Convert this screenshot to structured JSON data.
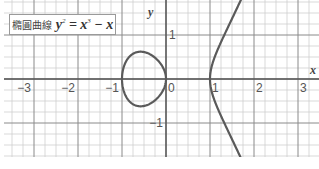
{
  "title": {
    "prefix": "橢圓曲線",
    "equation_lhs": "y",
    "lhs_exp": "2",
    "equals": " = ",
    "rhs_term1": "x",
    "rhs_exp": "3",
    "rhs_rest": " − x"
  },
  "chart_data": {
    "type": "line",
    "xlabel": "x",
    "ylabel": "y",
    "xlim": [
      -3.7,
      3.4
    ],
    "ylim": [
      -1.77,
      1.8
    ],
    "grid": true,
    "minor_grid_step": 0.25,
    "major_grid_step": 1,
    "x_ticks": [
      {
        "value": -3,
        "label": "−3"
      },
      {
        "value": -2,
        "label": "−2"
      },
      {
        "value": -1,
        "label": "−1"
      },
      {
        "value": 0,
        "label": "0"
      },
      {
        "value": 1,
        "label": "1"
      },
      {
        "value": 2,
        "label": "2"
      },
      {
        "value": 3,
        "label": "3"
      }
    ],
    "y_ticks": [
      {
        "value": 1,
        "label": "1"
      },
      {
        "value": -1,
        "label": "−1"
      }
    ],
    "series": [
      {
        "name": "y² = x³ − x (bounded component)",
        "x": [
          -1,
          -0.95,
          -0.9,
          -0.8,
          -0.7,
          -0.577,
          -0.5,
          -0.4,
          -0.3,
          -0.2,
          -0.1,
          -0.05,
          0
        ],
        "y_upper": [
          0,
          0.305,
          0.414,
          0.537,
          0.585,
          0.62,
          0.612,
          0.58,
          0.522,
          0.438,
          0.315,
          0.223,
          0
        ]
      },
      {
        "name": "y² = x³ − x (unbounded component)",
        "x": [
          1,
          1.02,
          1.05,
          1.1,
          1.2,
          1.3,
          1.4,
          1.5,
          1.6,
          1.65,
          1.7
        ],
        "y_upper": [
          0,
          0.203,
          0.324,
          0.48,
          0.812,
          0.986,
          1.166,
          1.369,
          1.58,
          1.69,
          1.8
        ]
      }
    ],
    "colors": {
      "curve": "#5a5a5a",
      "major_grid": "#8a8a8a",
      "minor_grid": "#cfcfcf",
      "axis": "#555555"
    }
  }
}
